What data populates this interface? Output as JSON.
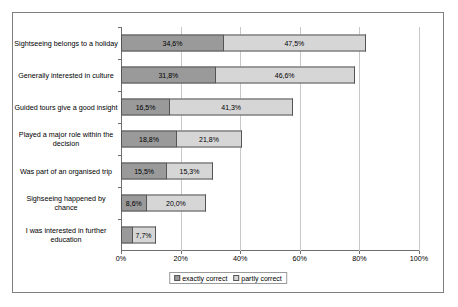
{
  "chart_data": {
    "type": "bar",
    "subtype": "stacked-horizontal",
    "title": "",
    "xlabel": "",
    "ylabel": "",
    "xlim": [
      0,
      100
    ],
    "xticks": [
      "0%",
      "20%",
      "40%",
      "60%",
      "80%",
      "100%"
    ],
    "xtick_values": [
      0,
      20,
      40,
      60,
      80,
      100
    ],
    "grid": true,
    "legend_position": "bottom",
    "categories": [
      "Sightseeing belongs to a holiday",
      "Generally interested in culture",
      "Guided tours give a good insight",
      "Played a major role within the  decision",
      "Was part of an organised trip",
      "Sighseeing happened by chance",
      "I was interested in further education"
    ],
    "series": [
      {
        "name": "exactly correct",
        "color": "#9a9a9a",
        "values": [
          34.6,
          31.8,
          16.5,
          18.8,
          15.5,
          8.6,
          3.9
        ],
        "labels": [
          "34,6%",
          "31,8%",
          "16,5%",
          "18,8%",
          "15,5%",
          "8,6%",
          "3,9%"
        ]
      },
      {
        "name": "partly correct",
        "color": "#d6d6d6",
        "values": [
          47.5,
          46.6,
          41.3,
          21.8,
          15.3,
          20.0,
          7.7
        ],
        "labels": [
          "47,5%",
          "46,6%",
          "41,3%",
          "21,8%",
          "15,3%",
          "20,0%",
          "7,7%"
        ]
      }
    ]
  },
  "legend": {
    "items": [
      {
        "label": "exactly correct"
      },
      {
        "label": "partly correct"
      }
    ]
  }
}
